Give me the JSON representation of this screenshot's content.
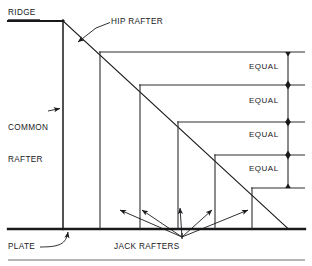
{
  "diagram": {
    "labels": {
      "ridge": "RIDGE",
      "hip_rafter": "HIP RAFTER",
      "common_rafter_line1": "COMMON",
      "common_rafter_line2": "RAFTER",
      "plate": "PLATE",
      "jack_rafters": "JACK RAFTERS",
      "equal_1": "EQUAL",
      "equal_2": "EQUAL",
      "equal_3": "EQUAL",
      "equal_4": "EQUAL"
    },
    "colors": {
      "line": "#19191c",
      "background": "#ffffff",
      "thin_line": "#3a3a3e"
    },
    "geometry": {
      "ridge_line": {
        "x1": 8,
        "y1": 21,
        "x2": 63,
        "y2": 21
      },
      "common_rafter_line": {
        "x1": 63,
        "y1": 21,
        "x2": 63,
        "y2": 229
      },
      "hip_rafter_line": {
        "x1": 63,
        "y1": 21,
        "x2": 288,
        "y2": 229
      },
      "plate_line": {
        "x1": 8,
        "y1": 229,
        "x2": 305,
        "y2": 229
      },
      "bottom_border": {
        "x1": 8,
        "y1": 260,
        "x2": 305,
        "y2": 260
      },
      "dimension_line_x": 288,
      "jack_converge_point": {
        "x": 182,
        "y": 238
      },
      "horizontals": [
        {
          "y": 52,
          "x1": 100,
          "x2": 305
        },
        {
          "y": 85,
          "x1": 140,
          "x2": 305
        },
        {
          "y": 122,
          "x1": 178,
          "x2": 305
        },
        {
          "y": 155,
          "x1": 215,
          "x2": 305
        },
        {
          "y": 188,
          "x1": 252,
          "x2": 305
        }
      ],
      "verticals": [
        {
          "x": 100,
          "y1": 52,
          "y2": 229
        },
        {
          "x": 140,
          "y1": 85,
          "y2": 229
        },
        {
          "x": 178,
          "y1": 122,
          "y2": 229
        },
        {
          "x": 215,
          "y1": 155,
          "y2": 229
        },
        {
          "x": 252,
          "y1": 188,
          "y2": 229
        }
      ],
      "dimension_ticks": [
        52,
        85,
        122,
        155,
        188
      ]
    }
  }
}
